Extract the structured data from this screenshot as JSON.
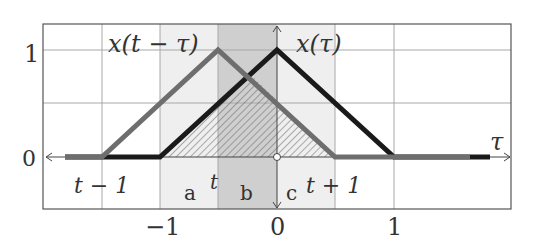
{
  "diagram": {
    "curves": [
      {
        "name": "x(t-τ)",
        "label": "x(t − τ)",
        "color": "#6e6e6e",
        "points": [
          [
            -2.0,
            0
          ],
          [
            -1.5,
            0
          ],
          [
            -0.5,
            1
          ],
          [
            0.5,
            0
          ],
          [
            2.0,
            0
          ]
        ]
      },
      {
        "name": "x(τ)",
        "label": "x(τ)",
        "color": "#1a1a1a",
        "points": [
          [
            -2.0,
            0
          ],
          [
            -1,
            0
          ],
          [
            0,
            1
          ],
          [
            1,
            0
          ],
          [
            2.0,
            0
          ]
        ]
      }
    ],
    "t_value": -0.5,
    "regions": {
      "a": "a",
      "b": "b",
      "c": "c"
    },
    "axis": {
      "x_label": "τ",
      "x_ticks": [
        "−1",
        "0",
        "1"
      ],
      "y_ticks": [
        "0",
        "1"
      ]
    },
    "annotations": {
      "t_minus_1": "t − 1",
      "t": "t",
      "t_plus_1": "t + 1",
      "x_shifted": "x(t − τ)",
      "x_orig": "x(τ)"
    },
    "colors": {
      "grid": "#9a9a9a",
      "band_light": "#efefef",
      "band_dark": "#cfcfcf",
      "hatch": "#555555"
    }
  }
}
